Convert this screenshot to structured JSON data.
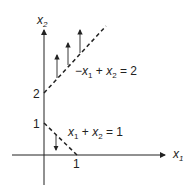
{
  "diagram": {
    "axes": {
      "x_label": "x",
      "x_sub": "1",
      "y_label": "x",
      "y_sub": "2"
    },
    "ticks": {
      "y2": "2",
      "y1": "1",
      "x1": "1"
    },
    "constraints": [
      {
        "equation": "−x₁ + x₂ = 2",
        "parts": [
          "−",
          "x",
          "1",
          " + ",
          "x",
          "2",
          " = 2"
        ],
        "style": "dashed",
        "feasible_side": "above"
      },
      {
        "equation": "x₁ + x₂ = 1",
        "parts": [
          "x",
          "1",
          " + ",
          "x",
          "2",
          " = 1"
        ],
        "style": "dashed",
        "feasible_side": "below"
      }
    ],
    "colors": {
      "ink": "#222222",
      "background": "#ffffff"
    }
  }
}
